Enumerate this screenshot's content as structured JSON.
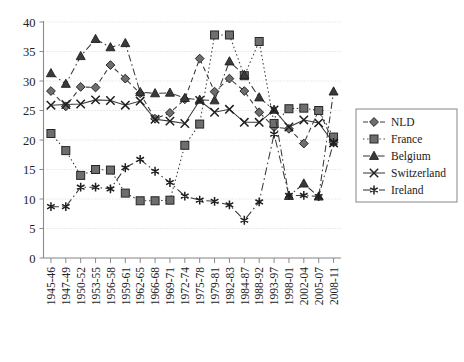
{
  "chart_data": {
    "type": "line",
    "title": "",
    "subtitle": "",
    "xlabel": "",
    "ylabel": "",
    "ylim": [
      0,
      40
    ],
    "yticks": [
      0,
      5,
      10,
      15,
      20,
      25,
      30,
      35,
      40
    ],
    "grid": true,
    "legend_position": "right",
    "categories": [
      "1945-46",
      "1947-49",
      "1950-52",
      "1953-55",
      "1956-58",
      "1959-61",
      "1962-65",
      "1966-68",
      "1969-71",
      "1972-74",
      "1975-78",
      "1979-81",
      "1982-83",
      "1984-87",
      "1988-92",
      "1993-97",
      "1998-01",
      "2002-04",
      "2005-07",
      "2008-11"
    ],
    "series": [
      {
        "name": "NLD",
        "marker": "diamond",
        "dash": "dashed",
        "color": "#3a3a3a",
        "values": [
          28.3,
          25.7,
          29.0,
          28.9,
          32.7,
          30.4,
          27.9,
          23.6,
          24.6,
          26.9,
          33.8,
          28.2,
          30.4,
          28.3,
          24.7,
          22.2,
          21.9,
          19.4,
          25.0,
          19.6
        ]
      },
      {
        "name": "France",
        "marker": "square",
        "dash": "dotted",
        "color": "#4a4a4a",
        "values": [
          21.1,
          18.2,
          14.0,
          15.0,
          14.9,
          11.0,
          9.7,
          9.7,
          9.8,
          19.1,
          22.7,
          37.8,
          37.8,
          30.9,
          36.7,
          22.8,
          25.3,
          25.4,
          25.0,
          20.5
        ]
      },
      {
        "name": "Belgium",
        "marker": "triangle",
        "dash": "dashdot",
        "color": "#2f2f2f",
        "values": [
          31.3,
          29.5,
          34.2,
          37.1,
          35.7,
          36.4,
          28.1,
          27.9,
          28.0,
          27.1,
          26.8,
          26.7,
          33.3,
          31.0,
          27.2,
          25.1,
          10.5,
          12.6,
          10.4,
          28.2
        ]
      },
      {
        "name": "Switzerland",
        "marker": "cross",
        "dash": "solid",
        "color": "#3a3a3a",
        "values": [
          25.9,
          26.0,
          26.1,
          26.8,
          26.7,
          25.9,
          26.6,
          23.5,
          23.2,
          22.8,
          26.7,
          24.7,
          25.2,
          23.0,
          23.0,
          25.1,
          22.2,
          23.4,
          22.9,
          19.5
        ]
      },
      {
        "name": "Ireland",
        "marker": "asterisk",
        "dash": "dashdot-long",
        "color": "#2a2a2a",
        "values": [
          8.7,
          8.7,
          12.0,
          12.0,
          11.7,
          15.3,
          16.7,
          14.7,
          12.8,
          10.5,
          9.8,
          9.6,
          9.0,
          6.4,
          9.5,
          21.0,
          10.6,
          10.6,
          10.4,
          19.6
        ]
      }
    ]
  },
  "legend": {
    "items": [
      {
        "label": "NLD"
      },
      {
        "label": "France"
      },
      {
        "label": "Belgium"
      },
      {
        "label": "Switzerland"
      },
      {
        "label": "Ireland"
      }
    ]
  }
}
